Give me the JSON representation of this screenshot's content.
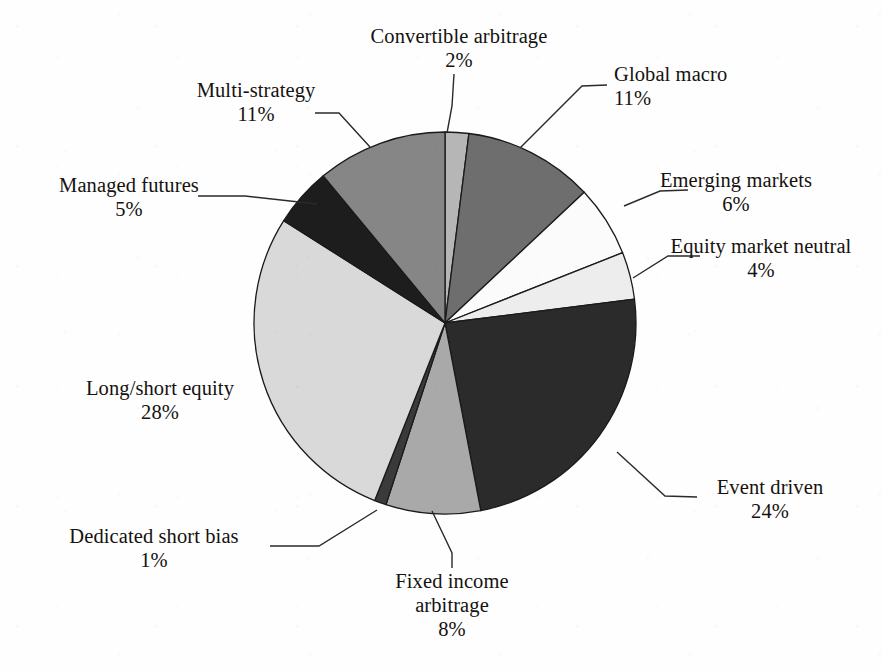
{
  "chart_data": {
    "type": "pie",
    "title": "",
    "subtitle": "",
    "xlabel": "",
    "ylabel": "",
    "legend_position": "none",
    "grid": false,
    "start_angle_deg": 0,
    "direction": "clockwise",
    "units": "percent",
    "total": 100,
    "categories": [
      "Convertible arbitrage",
      "Global macro",
      "Emerging markets",
      "Equity market neutral",
      "Event driven",
      "Fixed income arbitrage",
      "Dedicated short bias",
      "Long/short equity",
      "Managed futures",
      "Multi-strategy"
    ],
    "values": [
      2,
      11,
      6,
      4,
      24,
      8,
      1,
      28,
      5,
      11
    ],
    "colors": [
      "#b6b6b6",
      "#6e6e6e",
      "#fbfbfb",
      "#ededed",
      "#2b2b2b",
      "#a9a9a9",
      "#3a3a3a",
      "#d9d9d9",
      "#1d1d1d",
      "#868686"
    ],
    "slices": [
      {
        "label": "Convertible arbitrage",
        "value": 2,
        "pct_text": "2%",
        "color": "#b6b6b6"
      },
      {
        "label": "Global macro",
        "value": 11,
        "pct_text": "11%",
        "color": "#6e6e6e"
      },
      {
        "label": "Emerging markets",
        "value": 6,
        "pct_text": "6%",
        "color": "#fbfbfb"
      },
      {
        "label": "Equity market neutral",
        "value": 4,
        "pct_text": "4%",
        "color": "#ededed"
      },
      {
        "label": "Event driven",
        "value": 24,
        "pct_text": "24%",
        "color": "#2b2b2b"
      },
      {
        "label": "Fixed income arbitrage",
        "value": 8,
        "pct_text": "8%",
        "color": "#a9a9a9"
      },
      {
        "label": "Dedicated short bias",
        "value": 1,
        "pct_text": "1%",
        "color": "#3a3a3a"
      },
      {
        "label": "Long/short equity",
        "value": 28,
        "pct_text": "28%",
        "color": "#d9d9d9"
      },
      {
        "label": "Managed futures",
        "value": 5,
        "pct_text": "5%",
        "color": "#1d1d1d"
      },
      {
        "label": "Multi-strategy",
        "value": 11,
        "pct_text": "11%",
        "color": "#868686"
      }
    ]
  },
  "labels": {
    "convertible_arbitrage": {
      "name": "Convertible arbitrage",
      "pct": "2%"
    },
    "global_macro": {
      "name": "Global macro",
      "pct": "11%"
    },
    "emerging_markets": {
      "name": "Emerging markets",
      "pct": "6%"
    },
    "equity_market_neutral": {
      "name": "Equity market neutral",
      "pct": "4%"
    },
    "event_driven": {
      "name": "Event driven",
      "pct": "24%"
    },
    "fixed_income_arbitrage": {
      "name_line1": "Fixed income",
      "name_line2": "arbitrage",
      "pct": "8%"
    },
    "dedicated_short_bias": {
      "name": "Dedicated short bias",
      "pct": "1%"
    },
    "long_short_equity": {
      "name": "Long/short equity",
      "pct": "28%"
    },
    "managed_futures": {
      "name": "Managed futures",
      "pct": "5%"
    },
    "multi_strategy": {
      "name": "Multi-strategy",
      "pct": "11%"
    }
  },
  "style": {
    "page_background": "#ffffff",
    "text_color": "#15120f",
    "leader_line_color": "#2a2a2a",
    "slice_border_color": "#1a1a1a"
  }
}
